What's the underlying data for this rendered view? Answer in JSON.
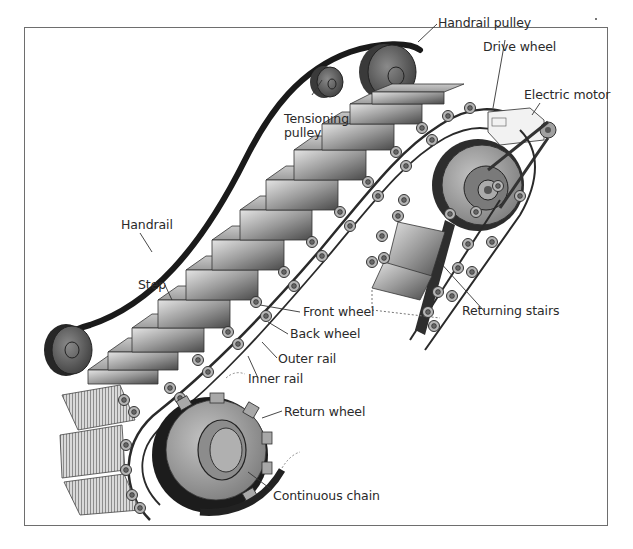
{
  "diagram": {
    "colors": {
      "frame": "#6e6e6e",
      "handrail": "#1a1a1a",
      "step_light": "#d8d8d8",
      "step_dark": "#5a5a5a",
      "wheel": "#8a8a8a",
      "label_text": "#2a2a2a",
      "leader_line": "#333333"
    },
    "labels": {
      "handrail_pulley": "Handrail pulley",
      "drive_wheel": "Drive wheel",
      "electric_motor": "Electric motor",
      "tensioning_pulley_line1": "Tensioning",
      "tensioning_pulley_line2": "pulley",
      "handrail": "Handrail",
      "step": "Step",
      "front_wheel": "Front wheel",
      "back_wheel": "Back wheel",
      "outer_rail": "Outer rail",
      "inner_rail": "Inner rail",
      "returning_stairs": "Returning stairs",
      "return_wheel": "Return wheel",
      "continuous_chain": "Continuous chain"
    }
  }
}
